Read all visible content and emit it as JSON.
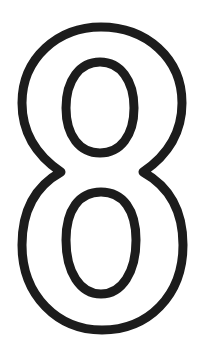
{
  "image": {
    "subject": "outlined numeral",
    "glyph": "8",
    "style": "outline",
    "colors": {
      "background": "#ffffff",
      "stroke": "#1c1c1c"
    }
  }
}
